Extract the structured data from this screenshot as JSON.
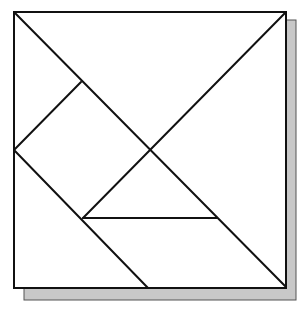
{
  "diagram": {
    "type": "tangram",
    "colors": {
      "background": "#ffffff",
      "line": "#111111",
      "shadow": "#c8c8c8"
    },
    "square": {
      "x": 14,
      "y": 12,
      "size": 272
    },
    "shadow": {
      "offset_x": 10,
      "offset_y": 12
    },
    "pieces": [
      {
        "name": "large-triangle-top",
        "points": "14,12 286,12 150,150"
      },
      {
        "name": "large-triangle-right",
        "points": "286,12 286,287 150,150"
      },
      {
        "name": "medium-triangle-bottom-left",
        "points": "14,150 14,288 148,288"
      },
      {
        "name": "square-piece",
        "points": "14,150 81,82 150,150 83,218"
      },
      {
        "name": "small-triangle-top-left",
        "points": "14,12 81,82 14,150"
      },
      {
        "name": "small-triangle-center",
        "points": "150,150 217,218 83,218"
      },
      {
        "name": "parallelogram",
        "points": "83,218 217,218 286,287 148,288"
      }
    ]
  }
}
